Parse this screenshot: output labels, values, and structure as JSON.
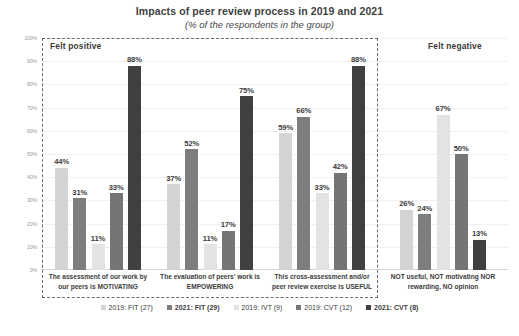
{
  "header": {
    "title": "Impacts of peer review process in 2019 and 2021",
    "subtitle": "(% of the respondents in the group)"
  },
  "annotations": {
    "positive": "Felt  positive",
    "negative": "Felt negative"
  },
  "chart_data": {
    "type": "bar",
    "title": "Impacts of peer review process in 2019 and 2021",
    "subtitle": "(% of the respondents in the group)",
    "xlabel": "",
    "ylabel": "",
    "ylim": [
      0,
      100
    ],
    "grid": true,
    "legend_position": "bottom",
    "ytick_labels": [
      "100%",
      "90%",
      "80%",
      "70%",
      "60%",
      "50%",
      "40%",
      "30%",
      "20%",
      "10%",
      "0%"
    ],
    "ytick_values": [
      100,
      90,
      80,
      70,
      60,
      50,
      40,
      30,
      20,
      10,
      0
    ],
    "categories": [
      "The assessment of our work by our peers is MOTIVATING",
      "The evaluation of peers' work is EMPOWERING",
      "This cross-assessment and/or peer review exercise is USEFUL",
      "NOT useful, NOT motivating NOR rewarding, NO opinion"
    ],
    "categories_lines": [
      [
        "The assessment of our work by",
        "our peers is MOTIVATING"
      ],
      [
        "The evaluation of peers' work is",
        "EMPOWERING"
      ],
      [
        "This cross-assessment and/or",
        "peer review exercise is USEFUL"
      ],
      [
        "NOT useful, NOT motivating NOR",
        "rewarding, NO opinion"
      ]
    ],
    "series": [
      {
        "name": "2019: FIT (27)",
        "color": "#d4d4d4",
        "values": [
          44,
          37,
          59,
          26
        ],
        "labels": [
          "44%",
          "37%",
          "59%",
          "26%"
        ]
      },
      {
        "name": "2021: FIT (29)",
        "color": "#7d7d7d",
        "values": [
          31,
          52,
          66,
          24
        ],
        "labels": [
          "31%",
          "52%",
          "66%",
          "24%"
        ]
      },
      {
        "name": "2019: IVT (9)",
        "color": "#e3e3e3",
        "values": [
          11,
          11,
          33,
          67
        ],
        "labels": [
          "11%",
          "11%",
          "33%",
          "67%"
        ]
      },
      {
        "name": "2019: CVT (12)",
        "color": "#757575",
        "values": [
          33,
          17,
          42,
          50
        ],
        "labels": [
          "33%",
          "17%",
          "42%",
          "50%"
        ]
      },
      {
        "name": "2021: CVT (8)",
        "color": "#404040",
        "values": [
          88,
          75,
          88,
          13
        ],
        "labels": [
          "88%",
          "75%",
          "88%",
          "13%"
        ]
      }
    ]
  },
  "legend": [
    {
      "label": "2019: FIT (27)",
      "color": "#d4d4d4",
      "bold": false
    },
    {
      "label": "2021: FIT (29)",
      "color": "#7d7d7d",
      "bold": true
    },
    {
      "label": "2019: IVT (9)",
      "color": "#e3e3e3",
      "bold": false
    },
    {
      "label": "2019: CVT (12)",
      "color": "#757575",
      "bold": false
    },
    {
      "label": "2021: CVT (8)",
      "color": "#404040",
      "bold": true
    }
  ]
}
